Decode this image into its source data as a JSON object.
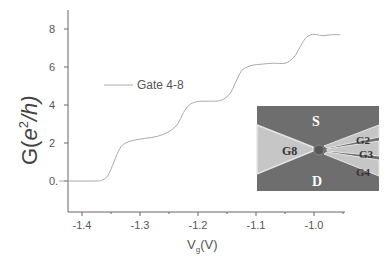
{
  "chart_data": {
    "type": "line",
    "title": "",
    "xlabel": "V_g(V)",
    "xlabel_main": "V",
    "xlabel_sub": "g",
    "xlabel_unit": "(V)",
    "ylabel": "G(e²/h)",
    "ylabel_prefix": "G(",
    "ylabel_e": "e",
    "ylabel_sup": "2",
    "ylabel_suffix": "/h)",
    "xlim": [
      -1.44,
      -0.93
    ],
    "ylim": [
      -1.6,
      9.2
    ],
    "x_ticks": [
      "-1.4",
      "-1.3",
      "-1.2",
      "-1.1",
      "-1.0"
    ],
    "x_tick_values": [
      -1.4,
      -1.3,
      -1.2,
      -1.1,
      -1.0
    ],
    "y_ticks": [
      "0.",
      "2",
      "4",
      "6",
      "8"
    ],
    "y_tick_values": [
      0,
      2,
      4,
      6,
      8
    ],
    "grid": false,
    "legend_position": "upper-left",
    "series": [
      {
        "name": "Gate 4-8",
        "color": "#aaaaaa",
        "x": [
          -1.44,
          -1.38,
          -1.365,
          -1.355,
          -1.345,
          -1.335,
          -1.325,
          -1.31,
          -1.29,
          -1.27,
          -1.25,
          -1.235,
          -1.225,
          -1.215,
          -1.205,
          -1.195,
          -1.18,
          -1.16,
          -1.145,
          -1.135,
          -1.125,
          -1.115,
          -1.105,
          -1.09,
          -1.07,
          -1.05,
          -1.035,
          -1.025,
          -1.015,
          -1.005,
          -0.995,
          -0.985,
          -0.97,
          -0.955
        ],
        "y": [
          0.0,
          0.0,
          0.05,
          0.3,
          1.0,
          1.7,
          2.0,
          2.15,
          2.25,
          2.35,
          2.6,
          3.0,
          3.6,
          4.0,
          4.15,
          4.2,
          4.2,
          4.25,
          4.6,
          5.2,
          5.8,
          6.0,
          6.1,
          6.15,
          6.2,
          6.2,
          6.5,
          7.0,
          7.5,
          7.7,
          7.7,
          7.65,
          7.7,
          7.7
        ]
      }
    ],
    "inset": {
      "description": "SEM image of quantum point contact device",
      "labels": [
        "S",
        "D",
        "G8",
        "G2",
        "G3",
        "G4"
      ]
    }
  },
  "legend": {
    "label": "Gate 4-8"
  },
  "inset": {
    "source_label": "S",
    "drain_label": "D",
    "gate8_label": "G8",
    "gate2_label": "G2",
    "gate3_label": "G3",
    "gate4_label": "G4",
    "colors": {
      "background": "#6e6e6e",
      "gate": "#c8c8c8",
      "edge": "#e8e8e8",
      "dot": "#555555"
    }
  }
}
